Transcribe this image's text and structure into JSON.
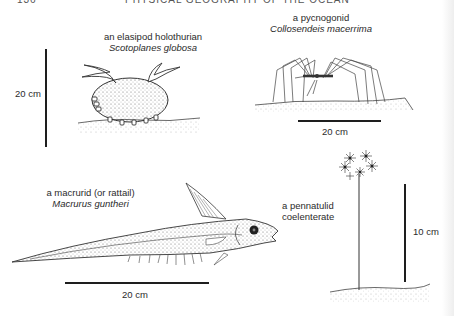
{
  "header": {
    "page_number": "136",
    "running_title": "PHYSICAL GEOGRAPHY OF THE OCEAN"
  },
  "figures": [
    {
      "id": "holothurian",
      "common_name": "an elasipod holothurian",
      "latin_name": "Scotoplanes globosa",
      "scale_label": "20 cm",
      "scale_orientation": "vertical"
    },
    {
      "id": "pycnogonid",
      "common_name": "a pycnogonid",
      "latin_name": "Collosendeis macerrima",
      "scale_label": "20 cm",
      "scale_orientation": "horizontal"
    },
    {
      "id": "macrurid",
      "common_name": "a macrurid (or rattail)",
      "latin_name": "Macrurus guntheri",
      "scale_label": "20 cm",
      "scale_orientation": "horizontal"
    },
    {
      "id": "pennatulid",
      "common_name": "a pennatulid",
      "common_name_line2": "coelenterate",
      "scale_label": "10 cm",
      "scale_orientation": "vertical"
    }
  ]
}
